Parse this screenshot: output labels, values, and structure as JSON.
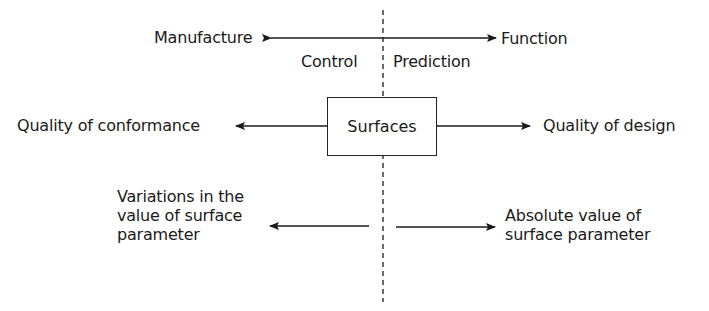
{
  "diagram": {
    "top_row": {
      "left_label": "Manufacture",
      "right_label": "Function",
      "arrow": "bidirectional"
    },
    "divider_labels": {
      "left": "Control",
      "right": "Prediction"
    },
    "center_box": {
      "label": "Surfaces"
    },
    "middle_row": {
      "left_label": "Quality of conformance",
      "right_label": "Quality of design"
    },
    "bottom_row": {
      "left_label": "Variations in the\nvalue of surface\nparameter",
      "right_label": "Absolute value of\nsurface parameter"
    },
    "colors": {
      "ink": "#1a1a1a",
      "background": "#ffffff"
    }
  }
}
